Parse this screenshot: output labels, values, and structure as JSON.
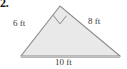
{
  "problem": {
    "number": "2."
  },
  "figure": {
    "type": "right-triangle",
    "fill_color": "#e9e9e9",
    "stroke_color": "#8c8c8c",
    "right_angle_marker": true,
    "right_angle_vertex": "apex",
    "vertices": {
      "apex": [
        60,
        6
      ],
      "left": [
        21,
        56
      ],
      "right": [
        120,
        56
      ]
    },
    "labels": {
      "left_leg": "6 ft",
      "right_leg": "8 ft",
      "base": "10 ft"
    },
    "units": "ft",
    "side_lengths": {
      "leg_a": 6,
      "leg_b": 8,
      "hypotenuse": 10
    }
  }
}
